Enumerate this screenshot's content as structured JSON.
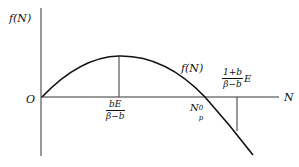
{
  "diagram": {
    "y_axis_label": "f(N)",
    "x_axis_label": "N",
    "origin_label": "O",
    "curve_label": "f(N)",
    "peak_label": {
      "numerator": "bE",
      "denominator": "β−b"
    },
    "root_label": {
      "base": "N",
      "sup": "0",
      "sub": "p"
    },
    "point_label": {
      "numerator": "1+b",
      "denominator": "β−b",
      "suffix": "E"
    },
    "colors": {
      "line": "#111111",
      "background": "#ffffff"
    }
  }
}
